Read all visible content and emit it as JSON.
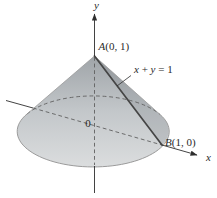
{
  "figure": {
    "labels": {
      "y_axis": "y",
      "x_axis": "x",
      "origin": "0",
      "apex_point_name": "A",
      "apex_point_coords": "(0, 1)",
      "base_point_name": "B",
      "base_point_coords": "(1, 0)",
      "line_eq_x": "x",
      "line_eq_plus": " + ",
      "line_eq_y": "y",
      "line_eq_equals": " = 1"
    },
    "colors": {
      "background": "#ffffff",
      "cone_top": "#9fa4a8",
      "cone_mid": "#c3c7ca",
      "cone_bottom": "#dbddde",
      "cone_right_shade": "rgba(70,80,88,0.14)",
      "outline": "#9b9b9b",
      "generator_line": "#454545",
      "dashed_line": "#606060",
      "axis": "#2e2e2e",
      "text": "#2a2a2a"
    }
  }
}
